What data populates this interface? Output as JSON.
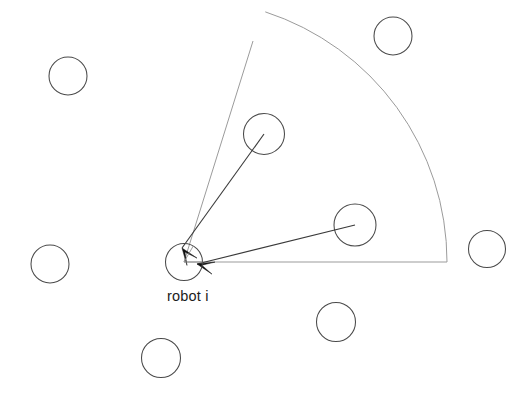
{
  "figure": {
    "background_color": "#ffffff",
    "width": 530,
    "height": 395
  },
  "labels": {
    "robot_label": "robot i"
  },
  "colors": {
    "circle_stroke": "#4a4a4a",
    "circle_stroke_faint": "#8a8a8a",
    "sector_stroke": "#9b9b9b",
    "vector_stroke": "#3a3a3a",
    "arrow_fill": "#111111",
    "text": "#1c1c1c"
  },
  "geometry": {
    "robot": {
      "cx": 184,
      "cy": 262,
      "r": 18.5
    },
    "sector": {
      "apex_x": 184,
      "apex_y": 262,
      "radius": 263,
      "start_angle_deg": 0,
      "end_angle_deg": 72,
      "baseline_end_x": 447,
      "baseline_end_y": 262,
      "edge_end_x": 253,
      "edge_end_y": 41
    },
    "neighbors_in_sector": [
      {
        "name": "neighbor-upper",
        "cx": 264,
        "cy": 134,
        "r": 20.5
      },
      {
        "name": "neighbor-right",
        "cx": 355,
        "cy": 225,
        "r": 21.0
      }
    ],
    "neighbors_outside": [
      {
        "name": "neighbor-top-left",
        "cx": 68,
        "cy": 76,
        "r": 19.0
      },
      {
        "name": "neighbor-top-right",
        "cx": 393,
        "cy": 36,
        "r": 19.0
      },
      {
        "name": "neighbor-left",
        "cx": 50,
        "cy": 264,
        "r": 19.0
      },
      {
        "name": "neighbor-right-edge",
        "cx": 487,
        "cy": 249,
        "r": 18.5
      },
      {
        "name": "neighbor-bottom-right",
        "cx": 336,
        "cy": 322,
        "r": 19.5
      },
      {
        "name": "neighbor-bottom",
        "cx": 161,
        "cy": 358,
        "r": 19.5
      }
    ],
    "vectors": [
      {
        "name": "vector-from-upper-neighbor",
        "from_x": 264,
        "from_y": 134,
        "to_x": 182,
        "to_y": 248,
        "arrow_angle_deg": 234
      },
      {
        "name": "vector-from-right-neighbor",
        "from_x": 355,
        "from_y": 225,
        "to_x": 197,
        "to_y": 264,
        "arrow_angle_deg": 194
      }
    ],
    "label_position": {
      "x": 167,
      "y": 301
    }
  }
}
